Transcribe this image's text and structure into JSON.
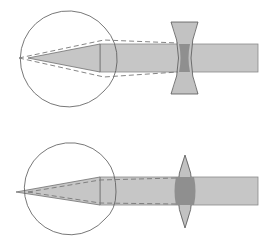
{
  "diagram": {
    "title": "",
    "colors": {
      "background": "#ffffff",
      "outline": "#555555",
      "beam_fill": "#c4c4c4",
      "beam_edge": "#7a7a7a",
      "lens_fill": "#bdbdbd",
      "lens_overlap": "#8f8f8f",
      "dashed": "#777777"
    },
    "panels": [
      {
        "id": "myopia-correction",
        "description": "Eye with diverging (concave) corrective lens",
        "lens_type": "concave"
      },
      {
        "id": "hyperopia-correction",
        "description": "Eye with converging (convex) corrective lens",
        "lens_type": "convex"
      }
    ]
  }
}
